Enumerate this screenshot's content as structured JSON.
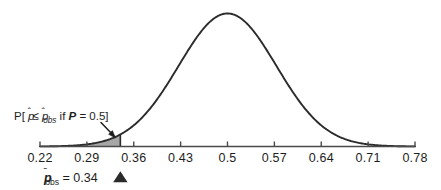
{
  "chart_data": {
    "type": "area",
    "title": "",
    "subtitle": "",
    "xlabel": "",
    "ylabel": "",
    "grid": false,
    "legend": null,
    "xlim": [
      0.22,
      0.78
    ],
    "ylim": [
      0,
      1
    ],
    "xticks": [
      "0.22",
      "0.29",
      "0.36",
      "0.43",
      "0.5",
      "0.57",
      "0.64",
      "0.71",
      "0.78"
    ],
    "xtick_values": [
      0.22,
      0.29,
      0.36,
      0.43,
      0.5,
      0.57,
      0.64,
      0.71,
      0.78
    ],
    "curve": {
      "name": "sampling distribution of p-hat under P = 0.5",
      "distribution": "normal",
      "mean": 0.5,
      "sd": 0.073,
      "peak_x": 0.5,
      "peak_y": 1.0
    },
    "shaded_region": {
      "label": "p-value tail area",
      "from": 0.22,
      "to": 0.34,
      "fill_color": "#9a9a9a",
      "opacity": 0.85
    },
    "markers": [
      {
        "name": "p-hat-observed",
        "x": 0.34,
        "symbol": "triangle",
        "color": "#2b2b2b"
      }
    ],
    "annotations": [
      {
        "name": "tail-probability-annotation",
        "text": "P[ p̂ ≤ p̂obs if P = 0.5]",
        "points_to_x": 0.34,
        "arrow": true
      }
    ]
  },
  "annotation": {
    "open_bracket": "P[ ",
    "phat": "p",
    "le": " ≤ ",
    "phat_obs": "p",
    "phat_obs_sub": "obs",
    "if_word": " if ",
    "bold_p": "P",
    "equals_value": " = 0.5]"
  },
  "observed": {
    "symbol": "p",
    "subscript": "obs",
    "equals": " = ",
    "value": "0.34",
    "marker_glyph": "▲"
  },
  "axis": {
    "ticks": [
      "0.22",
      "0.29",
      "0.36",
      "0.43",
      "0.5",
      "0.57",
      "0.64",
      "0.71",
      "0.78"
    ]
  },
  "colors": {
    "curve": "#2b2b2b",
    "axis": "#4a4a4a",
    "shade": "#9a9a9a",
    "text": "#1d1d1d"
  }
}
